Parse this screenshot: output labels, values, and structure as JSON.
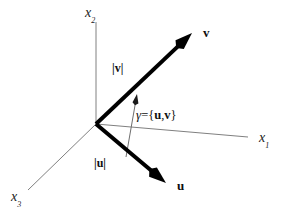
{
  "figure": {
    "background_color": "#ffffff",
    "width": 286,
    "height": 212
  },
  "axes": {
    "color": "#808080",
    "items": [
      {
        "id": "x1",
        "name": "horizontal-axis",
        "label_base": "x",
        "label_sub": "1",
        "x1": 96,
        "y1": 124,
        "x2": 248,
        "y2": 137,
        "label_x": 259,
        "label_y": 131
      },
      {
        "id": "x2",
        "name": "vertical-axis",
        "label_base": "x",
        "label_sub": "2",
        "x1": 96,
        "y1": 124,
        "x2": 96,
        "y2": 22,
        "label_x": 85,
        "label_y": 6
      },
      {
        "id": "x3",
        "name": "depth-axis",
        "label_base": "x",
        "label_sub": "3",
        "x1": 96,
        "y1": 124,
        "x2": 28,
        "y2": 190,
        "label_x": 11,
        "label_y": 190
      }
    ]
  },
  "vectors": {
    "color": "#000000",
    "items": [
      {
        "id": "v",
        "name": "vector-v",
        "label": "v",
        "x1": 96,
        "y1": 124,
        "x2": 192,
        "y2": 33,
        "label_x": 203,
        "label_y": 26,
        "magnitude_label": "|v|",
        "magnitude_x": 112,
        "magnitude_y": 62
      },
      {
        "id": "u",
        "name": "vector-u",
        "label": "u",
        "x1": 96,
        "y1": 124,
        "x2": 166,
        "y2": 183,
        "label_x": 177,
        "label_y": 179,
        "magnitude_label": "|u|",
        "magnitude_x": 94,
        "magnitude_y": 157
      }
    ]
  },
  "angle": {
    "name": "angle-gamma",
    "symbol": "γ",
    "equals": "=",
    "open_brace": "{",
    "first_vector": "u",
    "comma": ",",
    "second_vector": "v",
    "close_brace": "}",
    "full_text": "γ={u,v}",
    "label_x": 136,
    "label_y": 108,
    "indicator_color": "#6e6e6e",
    "indicator_x1": 126,
    "indicator_y1": 157,
    "indicator_x2": 137,
    "indicator_y2": 94
  }
}
